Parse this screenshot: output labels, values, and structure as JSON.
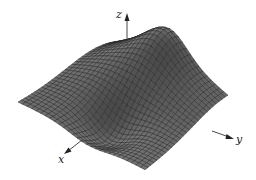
{
  "figure": {
    "type": "3d-surface-plot",
    "surface_color": "#6e6e6e",
    "mesh_color": "#1e1e1e",
    "axis_color": "#333333",
    "axes": {
      "x": {
        "label": "x"
      },
      "y": {
        "label": "y"
      },
      "z": {
        "label": "z"
      }
    }
  }
}
